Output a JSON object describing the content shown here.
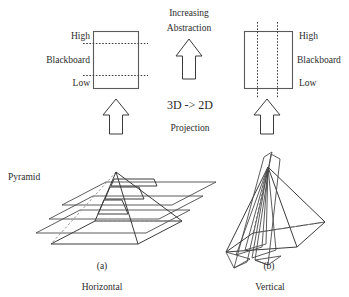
{
  "figure": {
    "caption_a_index": "(a)",
    "caption_a_label": "Horizontal",
    "caption_b_index": "(b)",
    "caption_b_label": "Vertical",
    "pyramid_label": "Pyramid"
  },
  "left_panel": {
    "name": "horizontal-projection-blackboard",
    "label_high": "High",
    "label_blackboard": "Blackboard",
    "label_low": "Low",
    "slice_orientation": "horizontal",
    "slice_count": 2
  },
  "right_panel": {
    "name": "vertical-projection-blackboard",
    "label_high": "High",
    "label_blackboard": "Blackboard",
    "label_low": "Low",
    "slice_orientation": "vertical",
    "slice_count": 2
  },
  "center_panel": {
    "increasing": "Increasing",
    "abstraction": "Abstraction",
    "projection_formula": "3D -> 2D",
    "projection_word": "Projection"
  },
  "colors": {
    "stroke": "#3b3b3b",
    "box_stroke": "#5a5a5a",
    "hidden_edge": "#8c8c8c",
    "text": "#2b2b2b",
    "background": "#ffffff"
  }
}
